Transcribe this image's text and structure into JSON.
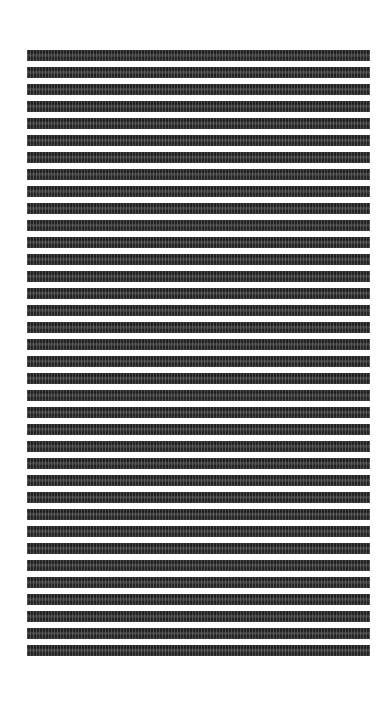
{
  "image": {
    "description": "abstract knit-like monochrome texture",
    "colors": {
      "background": "#ffffff",
      "dark": "#2a2a2a"
    },
    "pattern": {
      "row_period_px": 17,
      "dark_band_px": 11,
      "triangle_row_px": 6,
      "triangle_period_px": 5
    }
  }
}
